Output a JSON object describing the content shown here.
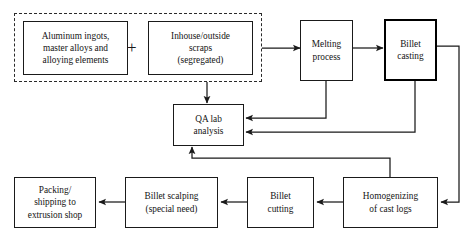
{
  "diagram": {
    "canvas": {
      "width": 470,
      "height": 242
    },
    "colors": {
      "stroke": "#1a1a1a",
      "emphasis_stroke": "#000000",
      "background": "#ffffff",
      "dashed_group": "#2a2a2a"
    },
    "operator_symbol": "+",
    "group": {
      "name": "charge-materials-group",
      "style": "dashed",
      "label": ""
    },
    "nodes": [
      {
        "id": "ingots",
        "label": "Aluminum ingots,\nmaster alloys and\nalloying elements",
        "emphasis": false
      },
      {
        "id": "scraps",
        "label": "Inhouse/outside\nscraps\n(segregated)",
        "emphasis": false
      },
      {
        "id": "melting",
        "label": "Melting\nprocess",
        "emphasis": false
      },
      {
        "id": "casting",
        "label": "Billet\ncasting",
        "emphasis": true
      },
      {
        "id": "qa",
        "label": "QA lab\nanalysis",
        "emphasis": false
      },
      {
        "id": "homogenizing",
        "label": "Homogenizing\nof cast logs",
        "emphasis": false
      },
      {
        "id": "cutting",
        "label": "Billet\ncutting",
        "emphasis": false
      },
      {
        "id": "scalping",
        "label": "Billet scalping\n(special need)",
        "emphasis": false
      },
      {
        "id": "packing",
        "label": "Packing/\nshipping to\nextrusion shop",
        "emphasis": false
      }
    ],
    "edges": [
      {
        "from": "scraps",
        "to": "melting"
      },
      {
        "from": "melting",
        "to": "casting"
      },
      {
        "from": "scraps",
        "to": "qa"
      },
      {
        "from": "melting",
        "to": "qa"
      },
      {
        "from": "casting",
        "to": "qa"
      },
      {
        "from": "casting",
        "to": "homogenizing"
      },
      {
        "from": "homogenizing",
        "to": "qa"
      },
      {
        "from": "homogenizing",
        "to": "cutting"
      },
      {
        "from": "cutting",
        "to": "scalping"
      },
      {
        "from": "scalping",
        "to": "packing"
      }
    ]
  }
}
